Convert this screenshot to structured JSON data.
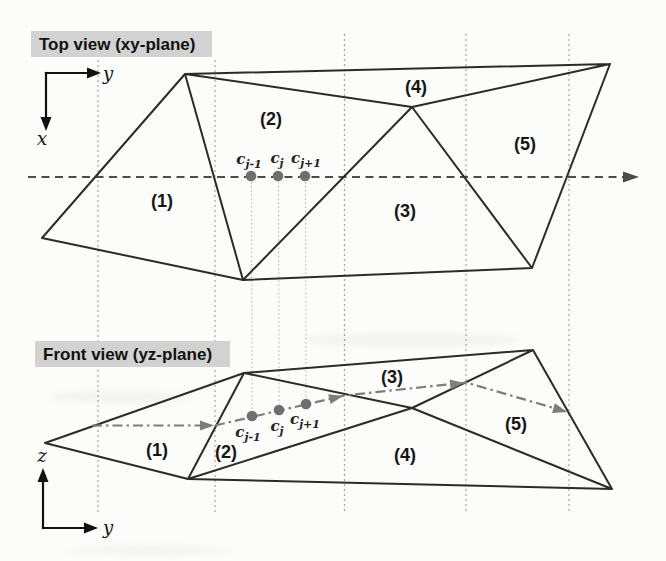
{
  "colors": {
    "page_background": "#fcfcfb",
    "triangle_edge": "#2b2b2b",
    "grid_line": "#a3a3a3",
    "connector_line": "#b5b5b5",
    "scan_line": "#4c4c4c",
    "profile_line": "#7d7d7d",
    "control_point": "#6f6f6f",
    "axis": "#111111",
    "title_background": "#d2d2d2",
    "text": "#161616"
  },
  "top_view": {
    "title": "Top view (xy-plane)",
    "axis_horizontal": "y",
    "axis_vertical": "x",
    "triangle_labels": [
      "(1)",
      "(2)",
      "(3)",
      "(4)",
      "(5)"
    ],
    "control_points": [
      {
        "base": "c",
        "sub": "j-1"
      },
      {
        "base": "c",
        "sub": "j"
      },
      {
        "base": "c",
        "sub": "j+1"
      }
    ]
  },
  "front_view": {
    "title": "Front view (yz-plane)",
    "axis_horizontal": "y",
    "axis_vertical": "z",
    "triangle_labels": [
      "(1)",
      "(2)",
      "(3)",
      "(4)",
      "(5)"
    ],
    "control_points": [
      {
        "base": "c",
        "sub": "j-1"
      },
      {
        "base": "c",
        "sub": "j"
      },
      {
        "base": "c",
        "sub": "j+1"
      }
    ]
  }
}
